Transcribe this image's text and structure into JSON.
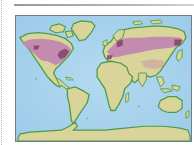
{
  "map": {
    "type": "world-map",
    "projection": "equirectangular",
    "highlighted_region": "mid-latitude band of North America and Eurasia",
    "colors": {
      "ocean": "#a9d3ec",
      "land": "#d9d59a",
      "coast": "#4f9a4a",
      "highlight": "#c48bb0",
      "highlight_dark": "#7a3e62",
      "frame": "#6e7f86"
    }
  }
}
